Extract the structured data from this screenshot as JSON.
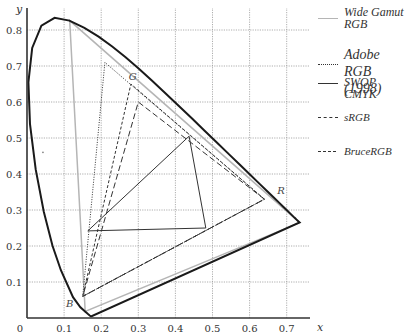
{
  "chart_data": {
    "type": "line",
    "title": "",
    "xlabel": "x",
    "ylabel": "y",
    "xlim": [
      0,
      0.75
    ],
    "ylim": [
      0,
      0.85
    ],
    "grid": true,
    "legend_position": "right",
    "x_ticks": [
      "0",
      "0.1",
      "0.2",
      "0.3",
      "0.4",
      "0.5",
      "0.6",
      "0.7"
    ],
    "y_ticks": [
      "0.1",
      "0.2",
      "0.3",
      "0.4",
      "0.5",
      "0.6",
      "0.7",
      "0.8"
    ],
    "point_labels": [
      {
        "text": "G",
        "x": 0.285,
        "y": 0.66
      },
      {
        "text": "R",
        "x": 0.685,
        "y": 0.345
      },
      {
        "text": "B",
        "x": 0.115,
        "y": 0.03
      }
    ],
    "spectral_locus": [
      [
        0.1741,
        0.005
      ],
      [
        0.1738,
        0.0049
      ],
      [
        0.1733,
        0.0048
      ],
      [
        0.1726,
        0.0048
      ],
      [
        0.1714,
        0.0051
      ],
      [
        0.1689,
        0.0069
      ],
      [
        0.1644,
        0.0109
      ],
      [
        0.1566,
        0.0177
      ],
      [
        0.144,
        0.0297
      ],
      [
        0.1241,
        0.0578
      ],
      [
        0.0913,
        0.1327
      ],
      [
        0.0687,
        0.2007
      ],
      [
        0.0454,
        0.295
      ],
      [
        0.0235,
        0.4127
      ],
      [
        0.0082,
        0.5384
      ],
      [
        0.0039,
        0.6548
      ],
      [
        0.0139,
        0.7502
      ],
      [
        0.0389,
        0.812
      ],
      [
        0.0743,
        0.8338
      ],
      [
        0.1142,
        0.8262
      ],
      [
        0.1547,
        0.8059
      ],
      [
        0.1929,
        0.7816
      ],
      [
        0.2296,
        0.7543
      ],
      [
        0.2658,
        0.7243
      ],
      [
        0.3016,
        0.6923
      ],
      [
        0.3373,
        0.6589
      ],
      [
        0.3731,
        0.6245
      ],
      [
        0.4087,
        0.5896
      ],
      [
        0.4441,
        0.5547
      ],
      [
        0.4788,
        0.5202
      ],
      [
        0.5125,
        0.4866
      ],
      [
        0.5448,
        0.4544
      ],
      [
        0.5752,
        0.4242
      ],
      [
        0.6029,
        0.3965
      ],
      [
        0.627,
        0.3725
      ],
      [
        0.6482,
        0.3514
      ],
      [
        0.6658,
        0.334
      ],
      [
        0.6801,
        0.3197
      ],
      [
        0.6915,
        0.3083
      ],
      [
        0.7006,
        0.2993
      ],
      [
        0.7079,
        0.292
      ],
      [
        0.714,
        0.2859
      ],
      [
        0.719,
        0.2809
      ],
      [
        0.723,
        0.277
      ],
      [
        0.726,
        0.274
      ],
      [
        0.7347,
        0.2653
      ]
    ],
    "series": [
      {
        "name": "Wide Gamut RGB",
        "style": "solid-light",
        "points": [
          [
            0.735,
            0.265
          ],
          [
            0.115,
            0.826
          ],
          [
            0.157,
            0.018
          ]
        ]
      },
      {
        "name": "Adobe RGB (1998)",
        "style": "dotted",
        "points": [
          [
            0.64,
            0.33
          ],
          [
            0.21,
            0.71
          ],
          [
            0.15,
            0.06
          ]
        ]
      },
      {
        "name": "SWOP CMYK",
        "style": "solid",
        "points": [
          [
            0.164,
            0.242
          ],
          [
            0.437,
            0.505
          ],
          [
            0.482,
            0.25
          ]
        ]
      },
      {
        "name": "sRGB",
        "style": "long-dash",
        "points": [
          [
            0.64,
            0.33
          ],
          [
            0.3,
            0.6
          ],
          [
            0.15,
            0.06
          ]
        ]
      },
      {
        "name": "BruceRGB",
        "style": "short-dash",
        "points": [
          [
            0.64,
            0.33
          ],
          [
            0.28,
            0.65
          ],
          [
            0.15,
            0.06
          ]
        ]
      }
    ],
    "white_point_marker": {
      "x": 0.043,
      "y": 0.46
    }
  },
  "legend": {
    "items": [
      {
        "label_line1": "Wide Gamut",
        "label_line2": "RGB"
      },
      {
        "label_line1": "Adobe RGB",
        "label_line2": "(1998)"
      },
      {
        "label_line1": "SWOP CMYK",
        "label_line2": ""
      },
      {
        "label_line1": "sRGB",
        "label_line2": ""
      },
      {
        "label_line1": "BruceRGB",
        "label_line2": ""
      }
    ]
  },
  "colors": {
    "axis": "#333333",
    "grid": "#999999",
    "locus": "#1a1a1a",
    "wide_gamut": "#b5b5b5",
    "lines": "#333333"
  }
}
